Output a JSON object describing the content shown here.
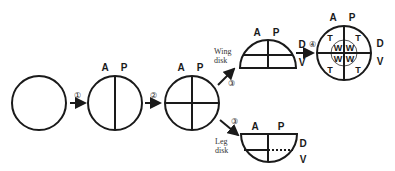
{
  "diagram": {
    "axis_labels": {
      "anterior": "A",
      "posterior": "P",
      "dorsal": "D",
      "ventral": "V"
    },
    "steps": [
      {
        "id": "step-1",
        "label": "①"
      },
      {
        "id": "step-2",
        "label": "②"
      },
      {
        "id": "step-3-wing",
        "label": "③"
      },
      {
        "id": "step-3-leg",
        "label": "③"
      },
      {
        "id": "step-4",
        "label": "④"
      }
    ],
    "wing_disk": {
      "line1": "Wing",
      "line2": "disk"
    },
    "leg_disk": {
      "line1": "Leg",
      "line2": "disk"
    },
    "final_disk": {
      "outer_label": "T",
      "inner_label": "W"
    },
    "colors": {
      "stroke": "#1a1a1a",
      "background": "#ffffff"
    }
  }
}
